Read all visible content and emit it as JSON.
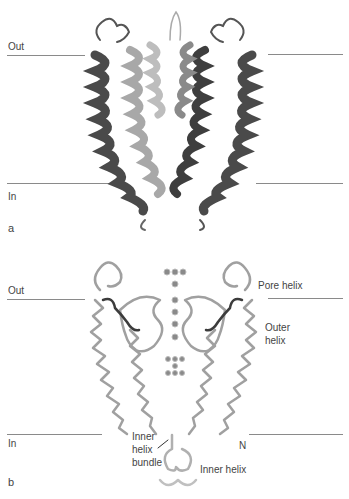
{
  "panel_a": {
    "label": "a",
    "out_label": "Out",
    "in_label": "In",
    "colors": {
      "dark_subunit": "#4a4a4a",
      "light_subunit": "#a8a8a8",
      "membrane_line": "#8a8a8a"
    }
  },
  "panel_b": {
    "label": "b",
    "out_label": "Out",
    "in_label": "In",
    "annotations": {
      "pore_helix": "Pore helix",
      "outer_helix": "Outer helix",
      "outer_helix_line1": "Outer",
      "outer_helix_line2": "helix",
      "n_terminus": "N",
      "inner_helix_bundle_line1": "Inner",
      "inner_helix_bundle_line2": "helix",
      "inner_helix_bundle_line3": "bundle",
      "inner_helix": "Inner helix"
    },
    "colors": {
      "backbone": "#9a9a9a",
      "selectivity_filter": "#3c3c3c",
      "ions": "#777777"
    }
  }
}
